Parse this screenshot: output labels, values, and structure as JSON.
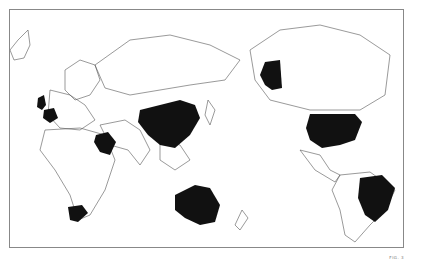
{
  "map": {
    "title": "World map (Pacific-centered) with highlighted countries",
    "projection": "Pacific-centered equirectangular outline",
    "highlight_color": "#111111",
    "outline_color": "#555555",
    "background_color": "#ffffff",
    "highlighted_countries": [
      "United Kingdom",
      "France",
      "Saudi Arabia",
      "China",
      "Australia",
      "South Africa",
      "United States (incl. Alaska)",
      "Brazil"
    ],
    "caption": "FIG. 3"
  }
}
